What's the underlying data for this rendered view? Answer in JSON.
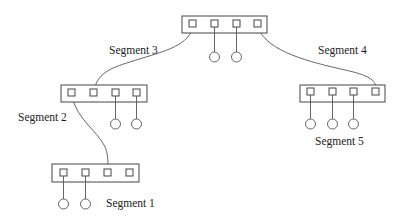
{
  "diagram": {
    "type": "network-topology",
    "colors": {
      "stroke": "#444444",
      "background": "#ffffff",
      "text": "#222222"
    },
    "segments": [
      {
        "id": "top",
        "label": "",
        "box": {
          "x": 182,
          "y": 16,
          "w": 85,
          "h": 17
        },
        "ports": [
          193,
          215,
          237,
          258
        ],
        "port_y": 24,
        "devices": [
          {
            "x": 214,
            "y": 57
          },
          {
            "x": 236,
            "y": 57
          }
        ]
      },
      {
        "id": "seg2",
        "label": "Segment 2",
        "box": {
          "x": 61,
          "y": 85,
          "w": 86,
          "h": 17
        },
        "ports": [
          72,
          94,
          116,
          137
        ],
        "port_y": 93,
        "devices": [
          {
            "x": 116,
            "y": 124
          },
          {
            "x": 137,
            "y": 124
          }
        ]
      },
      {
        "id": "seg5",
        "label": "Segment 5",
        "box": {
          "x": 300,
          "y": 85,
          "w": 85,
          "h": 17
        },
        "ports": [
          311,
          332,
          354,
          376
        ],
        "port_y": 92,
        "devices": [
          {
            "x": 311,
            "y": 124
          },
          {
            "x": 332,
            "y": 124
          },
          {
            "x": 354,
            "y": 124
          }
        ]
      },
      {
        "id": "seg1",
        "label": "Segment 1",
        "box": {
          "x": 52,
          "y": 164,
          "w": 87,
          "h": 18
        },
        "ports": [
          64,
          86,
          108,
          130
        ],
        "port_y": 173,
        "devices": [
          {
            "x": 64,
            "y": 204
          },
          {
            "x": 86,
            "y": 204
          }
        ]
      }
    ],
    "links": [
      {
        "label": "Segment 3",
        "from": "top.port1",
        "to": "seg2.port2"
      },
      {
        "label": "Segment 4",
        "from": "top.port4",
        "to": "seg5.port4"
      },
      {
        "label": "",
        "from": "seg2.port1",
        "to": "seg1.port3"
      }
    ],
    "labels": {
      "segment1": "Segment 1",
      "segment2": "Segment 2",
      "segment3": "Segment 3",
      "segment4": "Segment 4",
      "segment5": "Segment 5"
    }
  }
}
